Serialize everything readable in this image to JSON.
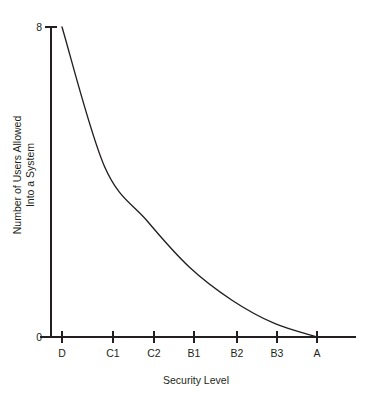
{
  "chart_data": {
    "type": "line",
    "title": "",
    "xlabel": "Security Level",
    "ylabel": "Number of Users Allowed Into a System",
    "ylabel_lines": [
      "Number of Users Allowed",
      "Into a System"
    ],
    "categories": [
      "D",
      "C1",
      "C2",
      "B1",
      "B2",
      "B3",
      "A"
    ],
    "x_tick_labels": [
      "D",
      "C1",
      "C2",
      "B1",
      "B2",
      "B3",
      "A"
    ],
    "y_tick_labels": [
      "0",
      "8"
    ],
    "ylim": [
      0,
      8
    ],
    "xlim": [
      0,
      6
    ],
    "grid": false,
    "legend": false,
    "series": [
      {
        "name": "Users allowed into a system",
        "color": "#231f20",
        "x": [
          "D",
          "C1",
          "C2",
          "B1",
          "B2",
          "B3",
          "A"
        ],
        "values": [
          8.0,
          4.4,
          3.0,
          1.8,
          0.95,
          0.35,
          0.0
        ]
      }
    ],
    "annotations": []
  },
  "axes": {
    "y_max_label": "8",
    "y_min_label": "0",
    "x_title": "Security Level",
    "y_title_line1": "Number of Users Allowed",
    "y_title_line2": "Into a System"
  },
  "colors": {
    "ink": "#231f20",
    "background": "#ffffff"
  }
}
